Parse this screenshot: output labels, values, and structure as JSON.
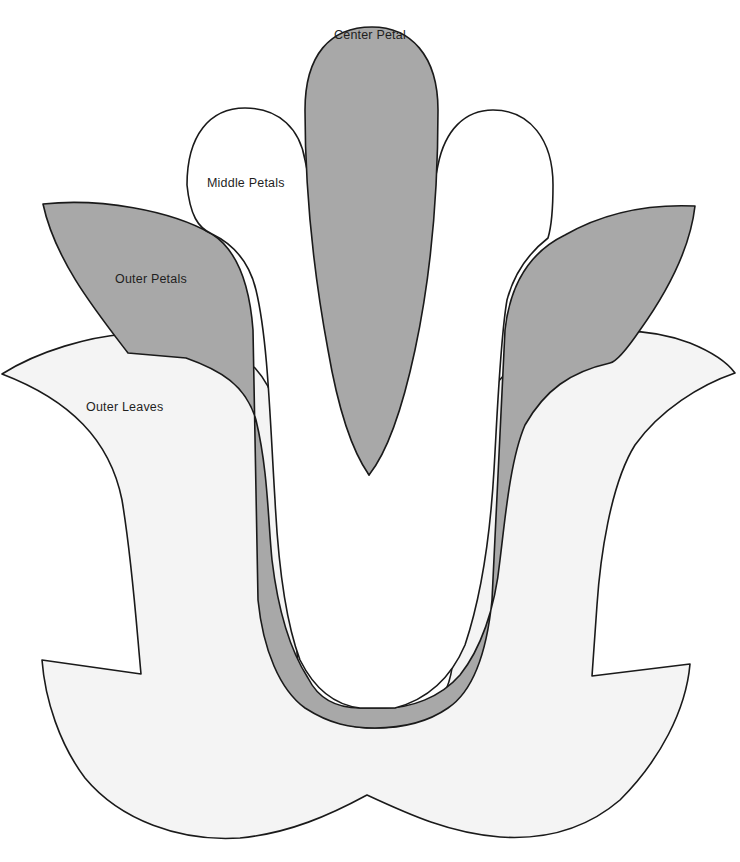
{
  "diagram": {
    "type": "flower-pattern-template",
    "colors": {
      "background": "#ffffff",
      "outline": "#1a1a1a",
      "center_petal": "#a8a8a8",
      "middle_petals": "#ffffff",
      "outer_petals": "#a8a8a8",
      "outer_leaves": "#f4f4f4",
      "label_text": "#1f1f1f"
    },
    "labels": {
      "center_petal": "Center Petal",
      "middle_petals": "Middle Petals",
      "outer_petals": "Outer Petals",
      "outer_leaves": "Outer Leaves"
    }
  }
}
